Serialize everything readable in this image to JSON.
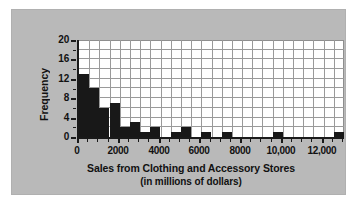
{
  "chart_data": {
    "type": "bar",
    "title": "",
    "xlabel": "Sales from Clothing and Accessory Stores (in millions of dollars)",
    "xlabel_line1": "Sales from Clothing and Accessory Stores",
    "xlabel_line2": "(in millions of dollars)",
    "ylabel": "Frequency",
    "xlim": [
      0,
      13000
    ],
    "ylim": [
      0,
      20
    ],
    "grid": true,
    "legend": false,
    "bin_width": 500,
    "x_ticks": [
      0,
      2000,
      4000,
      6000,
      8000,
      10000,
      12000
    ],
    "x_tick_labels": [
      "0",
      "2000",
      "4000",
      "6000",
      "8000",
      "10,000",
      "12,000"
    ],
    "y_ticks": [
      0,
      4,
      8,
      12,
      16,
      20
    ],
    "y_tick_labels": [
      "0",
      "4",
      "8",
      "12",
      "16",
      "20"
    ],
    "bin_starts": [
      0,
      500,
      1000,
      1500,
      2000,
      2500,
      3000,
      3500,
      4000,
      4500,
      5000,
      5500,
      6000,
      6500,
      7000,
      7500,
      8000,
      8500,
      9000,
      9500,
      10000,
      10500,
      11000,
      11500,
      12000,
      12500
    ],
    "values": [
      13,
      10,
      6,
      7,
      2,
      3,
      1,
      2,
      0,
      1,
      2,
      0,
      1,
      0,
      1,
      0,
      0,
      0,
      0,
      1,
      0,
      0,
      0,
      0,
      0,
      1
    ],
    "bar_color": "#181818",
    "plot_background": "#ffffff",
    "panel_background": "#b9b9b9",
    "grid_color": "#9a9a9a",
    "axis_color": "#1a1a1a"
  }
}
